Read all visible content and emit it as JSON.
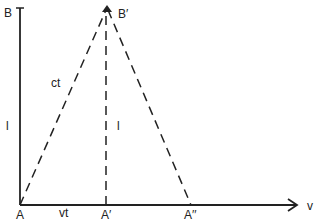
{
  "diagram": {
    "type": "light-clock / relativity geometry",
    "points": {
      "B": {
        "label": "B",
        "x": 20,
        "y": 8
      },
      "B_prime": {
        "label": "B′",
        "x": 107,
        "y": 8
      },
      "A": {
        "label": "A",
        "x": 20,
        "y": 205
      },
      "A_prime": {
        "label": "A′",
        "x": 106,
        "y": 205
      },
      "A_double_prime": {
        "label": "A′′",
        "x": 191,
        "y": 205
      }
    },
    "labels": {
      "ct": "ct",
      "l_left": "l",
      "l_middle": "l",
      "vt": "vt",
      "v": "v"
    },
    "colors": {
      "line": "#222222",
      "background": "#ffffff"
    }
  }
}
